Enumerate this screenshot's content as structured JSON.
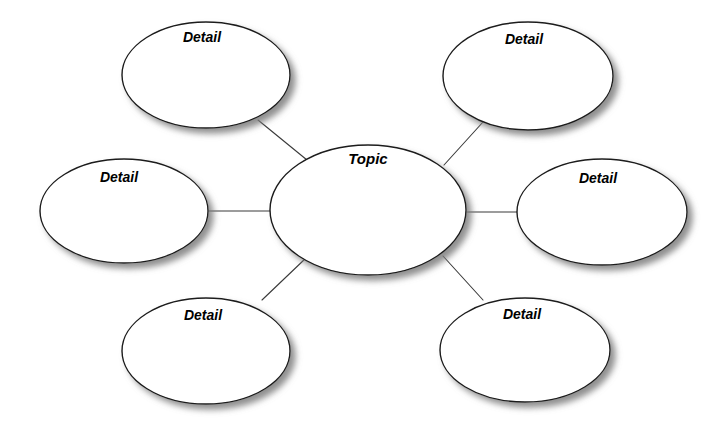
{
  "diagram": {
    "type": "concept-map-spider",
    "title": "",
    "background_color": "#ffffff",
    "node_fill_color": "#ffffff",
    "node_stroke_color": "#1a1a1a",
    "connector_color": "#3a3a3a",
    "shadow_color": "#8a8a8a",
    "canvas": {
      "width": 724,
      "height": 432
    },
    "center_node": {
      "id": "topic",
      "label": "Topic",
      "cx": 368,
      "cy": 210,
      "rx": 98,
      "ry": 65,
      "label_x": 368,
      "label_y": 160
    },
    "detail_nodes": [
      {
        "id": "detail-top-left",
        "label": "Detail",
        "cx": 206,
        "cy": 75,
        "rx": 84,
        "ry": 53,
        "label_x": 202,
        "label_y": 38
      },
      {
        "id": "detail-top-right",
        "label": "Detail",
        "cx": 528,
        "cy": 76,
        "rx": 85,
        "ry": 54,
        "label_x": 524,
        "label_y": 40
      },
      {
        "id": "detail-middle-left",
        "label": "Detail",
        "cx": 124,
        "cy": 211,
        "rx": 84,
        "ry": 52,
        "label_x": 119,
        "label_y": 178
      },
      {
        "id": "detail-middle-right",
        "label": "Detail",
        "cx": 602,
        "cy": 212,
        "rx": 85,
        "ry": 53,
        "label_x": 598,
        "label_y": 179
      },
      {
        "id": "detail-bottom-left",
        "label": "Detail",
        "cx": 206,
        "cy": 351,
        "rx": 84,
        "ry": 53,
        "label_x": 203,
        "label_y": 316
      },
      {
        "id": "detail-bottom-right",
        "label": "Detail",
        "cx": 525,
        "cy": 350,
        "rx": 85,
        "ry": 52,
        "label_x": 522,
        "label_y": 315
      }
    ],
    "connectors": [
      {
        "id": "connector-top-left",
        "from": "topic",
        "to": "detail-top-left",
        "x1": 258,
        "y1": 120,
        "x2": 307,
        "y2": 160
      },
      {
        "id": "connector-top-right",
        "from": "topic",
        "to": "detail-top-right",
        "x1": 444,
        "y1": 165,
        "x2": 483,
        "y2": 122
      },
      {
        "id": "connector-middle-left",
        "from": "topic",
        "to": "detail-middle-left",
        "x1": 208,
        "y1": 211,
        "x2": 271,
        "y2": 211
      },
      {
        "id": "connector-middle-right",
        "from": "topic",
        "to": "detail-middle-right",
        "x1": 466,
        "y1": 212,
        "x2": 518,
        "y2": 212
      },
      {
        "id": "connector-bottom-left",
        "from": "topic",
        "to": "detail-bottom-left",
        "x1": 262,
        "y1": 300,
        "x2": 306,
        "y2": 258
      },
      {
        "id": "connector-bottom-right",
        "from": "topic",
        "to": "detail-bottom-right",
        "x1": 443,
        "y1": 256,
        "x2": 483,
        "y2": 300
      }
    ]
  }
}
